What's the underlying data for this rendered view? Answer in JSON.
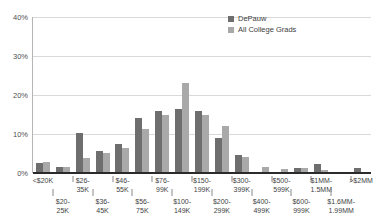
{
  "legend": {
    "position": "top-right",
    "entries": [
      {
        "label": "DePauw",
        "color": "#6e6e6e",
        "key": "depauw"
      },
      {
        "label": "All College Grads",
        "color": "#a9a9a9",
        "key": "all_college_grads"
      }
    ]
  },
  "axes": {
    "y_ticks": [
      "0%",
      "10%",
      "20%",
      "30%",
      "40%"
    ],
    "y_min": 0,
    "y_max": 40
  },
  "chart_data": {
    "type": "bar",
    "title": "",
    "subtitle": "",
    "xlabel": "",
    "ylabel": "",
    "ylim": [
      0,
      40
    ],
    "ytick_labels": [
      "0%",
      "10%",
      "20%",
      "30%",
      "40%"
    ],
    "grid": true,
    "legend_position": "top-right",
    "categories": [
      "<$20K",
      "$20-25K",
      "$26-35K",
      "$36-45K",
      "$46-55K",
      "$56-75K",
      "$76-99K",
      "$100-149K",
      "$150-199K",
      "$200-299K",
      "$300-399K",
      "$400-499K",
      "$500-599K",
      "$600-999K",
      "$1MM-1.5MM",
      "$1.6MM-1.99MM",
      ">$2MM"
    ],
    "series": [
      {
        "name": "DePauw",
        "color": "#6e6e6e",
        "values": [
          2.5,
          1.5,
          10.2,
          5.7,
          7.5,
          14.0,
          15.8,
          16.5,
          16.0,
          9.0,
          4.5,
          0.3,
          0.2,
          1.2,
          2.2,
          0.2,
          1.3
        ]
      },
      {
        "name": "All College Grads",
        "color": "#a9a9a9",
        "values": [
          2.8,
          1.6,
          3.8,
          5.2,
          6.3,
          11.3,
          15.0,
          23.0,
          14.8,
          12.0,
          4.2,
          1.6,
          1.0,
          1.3,
          0.8,
          0.2,
          0.0
        ]
      }
    ]
  }
}
